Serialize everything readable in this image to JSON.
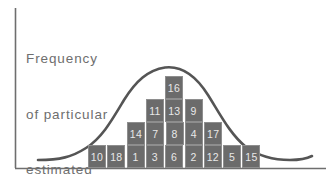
{
  "figure": {
    "caption_lines": [
      "Frequency",
      "of particular",
      "estimated",
      "values"
    ],
    "caption_text": "Frequency of particular estimated values",
    "text_color": "#6e6e6e",
    "axis_color": "#6e6e6e",
    "block_fill": "#6b6b6b",
    "block_border": "#8e8e8e",
    "block_text_color": "#e8e8e8",
    "curve_color": "#555555",
    "background": "#ffffff"
  },
  "chart_data": {
    "type": "bar",
    "title": "Frequency of particular estimated values",
    "xlabel": "",
    "ylabel": "Frequency of particular estimated values",
    "grid": false,
    "legend": null,
    "categories": [
      "1",
      "2",
      "3",
      "4",
      "5",
      "6",
      "7",
      "8",
      "9"
    ],
    "values": [
      1,
      2,
      3,
      4,
      3,
      2,
      1,
      1,
      1
    ],
    "overlay_curve": "normal-distribution",
    "rows": [
      {
        "row": 4,
        "y": 76,
        "start_x": 165,
        "labels": [
          "16"
        ]
      },
      {
        "row": 3,
        "y": 99,
        "start_x": 146,
        "labels": [
          "11",
          "13",
          "9"
        ]
      },
      {
        "row": 2,
        "y": 122,
        "start_x": 127,
        "labels": [
          "14",
          "7",
          "8",
          "4",
          "17"
        ]
      },
      {
        "row": 1,
        "y": 145,
        "start_x": 88,
        "labels": [
          "10",
          "18",
          "1",
          "3",
          "6",
          "2",
          "12",
          "5",
          "15"
        ]
      }
    ],
    "all_block_values": [
      16,
      11,
      13,
      9,
      14,
      7,
      8,
      4,
      17,
      10,
      18,
      1,
      3,
      6,
      2,
      12,
      5,
      15
    ],
    "block_width": 19.3,
    "block_height": 23
  }
}
